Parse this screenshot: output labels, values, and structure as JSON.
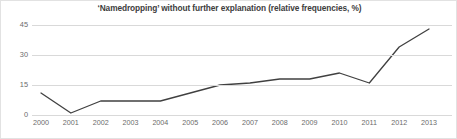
{
  "chart_data": {
    "type": "line",
    "title": "‘Namedropping’ without further explanation (relative frequencies, %)",
    "xlabel": "",
    "ylabel": "",
    "categories": [
      "2000",
      "2001",
      "2002",
      "2003",
      "2004",
      "2005",
      "2006",
      "2007",
      "2008",
      "2009",
      "2010",
      "2011",
      "2012",
      "2013"
    ],
    "values": [
      11,
      1,
      7,
      7,
      7,
      11,
      15,
      16,
      18,
      18,
      21,
      16,
      34,
      43
    ],
    "series": [
      {
        "name": "Namedropping without further explanation",
        "values": [
          11,
          1,
          7,
          7,
          7,
          11,
          15,
          16,
          18,
          18,
          21,
          16,
          34,
          43
        ]
      }
    ],
    "ylim": [
      0,
      45
    ],
    "yticks": [
      0,
      15,
      30,
      45
    ],
    "ytick_labels": [
      "0",
      "15",
      "30",
      "45"
    ],
    "grid": true,
    "legend": false,
    "line_color": "#404040",
    "grid_color": "#d9d9d9",
    "title_color": "#3d3d3d",
    "tick_color": "#6b6b6b",
    "background_color": "#ffffff"
  }
}
